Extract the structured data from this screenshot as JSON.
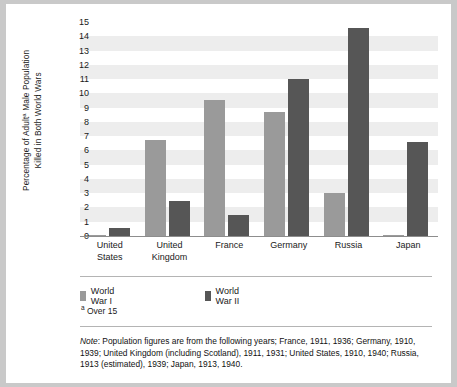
{
  "chart_data": {
    "type": "bar",
    "title": "",
    "xlabel": "",
    "ylabel": "Percentage of Adultᵃ Male Population\nKilled in Both World Wars",
    "ylim": [
      0,
      15
    ],
    "ytick_step": 1,
    "yticks": [
      0,
      1,
      2,
      3,
      4,
      5,
      6,
      7,
      8,
      9,
      10,
      11,
      12,
      13,
      14,
      15
    ],
    "grid": true,
    "grid_style": "alternating horizontal bands",
    "legend_position": "below-plot-left",
    "categories": [
      "United\nStates",
      "United\nKingdom",
      "France",
      "Germany",
      "Russia",
      "Japan"
    ],
    "series": [
      {
        "name": "World War I",
        "color": "#9a9a9a",
        "values": [
          0.1,
          6.7,
          9.5,
          8.7,
          3.05,
          0.1
        ]
      },
      {
        "name": "World War II",
        "color": "#565656",
        "values": [
          0.55,
          2.45,
          1.45,
          11.0,
          14.6,
          6.6
        ]
      }
    ]
  },
  "legend": {
    "items": [
      {
        "label": "World War I",
        "color": "#9a9a9a"
      },
      {
        "label": "World War II",
        "color": "#565656"
      }
    ]
  },
  "footnote": {
    "marker": "a",
    "text": "Over 15"
  },
  "note": {
    "label": "Note",
    "separator": ":",
    "text": " Population figures are from the following years; France, 1911, 1936; Germany, 1910, 1939; United Kingdom (including Scotland), 1911, 1931; United States, 1910, 1940; Russia, 1913 (estimated), 1939; Japan, 1913, 1940."
  }
}
